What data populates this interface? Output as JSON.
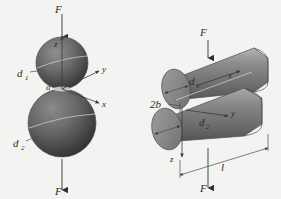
{
  "figure": {
    "background_color": "#f3f3f1",
    "ink_color": "#2b2b2b",
    "body_fill": "#6f6f6f",
    "body_fill_light": "#9a9a9a",
    "body_fill_dark": "#3d3d3d",
    "left_diagram": {
      "name": "two-spheres-in-contact",
      "force_top_label": "F",
      "force_bottom_label": "F",
      "diameter_upper_label": "d",
      "diameter_upper_sub": "1",
      "diameter_lower_label": "d",
      "diameter_lower_sub": "2",
      "contact_radius_label": "a",
      "axis_z_label": "z",
      "axis_y_label": "y",
      "axis_x_label": "x"
    },
    "right_diagram": {
      "name": "two-cylinders-in-contact",
      "force_top_label": "F",
      "force_bottom_label": "F",
      "diameter_upper_label": "d",
      "diameter_upper_sub": "1",
      "diameter_lower_label": "d",
      "diameter_lower_sub": "2",
      "contact_width_label": "2b",
      "length_label": "l",
      "axis_x_label": "x",
      "axis_y_label": "y",
      "axis_z_label": "z"
    }
  }
}
